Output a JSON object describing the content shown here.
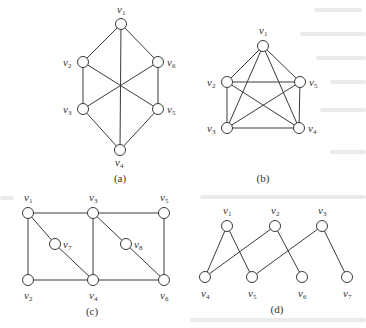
{
  "figure": {
    "node_radius": 5.5,
    "graphs": [
      {
        "id": "a",
        "caption": "(a)",
        "caption_pos": [
          120,
          182
        ],
        "nodes": [
          {
            "name": "v",
            "sub": "1",
            "x": 121,
            "y": 24,
            "lx": 117,
            "ly": 13
          },
          {
            "name": "v",
            "sub": "2",
            "x": 83,
            "y": 62,
            "lx": 63,
            "ly": 66
          },
          {
            "name": "v",
            "sub": "6",
            "x": 158,
            "y": 62,
            "lx": 167,
            "ly": 66
          },
          {
            "name": "v",
            "sub": "3",
            "x": 83,
            "y": 109,
            "lx": 63,
            "ly": 113
          },
          {
            "name": "v",
            "sub": "5",
            "x": 158,
            "y": 109,
            "lx": 167,
            "ly": 113
          },
          {
            "name": "v",
            "sub": "4",
            "x": 120,
            "y": 150,
            "lx": 115,
            "ly": 166
          }
        ],
        "edges": [
          [
            0,
            1
          ],
          [
            0,
            2
          ],
          [
            0,
            5
          ],
          [
            1,
            3
          ],
          [
            2,
            4
          ],
          [
            3,
            5
          ],
          [
            4,
            5
          ],
          [
            1,
            4
          ],
          [
            2,
            3
          ]
        ]
      },
      {
        "id": "b",
        "caption": "(b)",
        "caption_pos": [
          263,
          182
        ],
        "nodes": [
          {
            "name": "v",
            "sub": "1",
            "x": 263,
            "y": 46,
            "lx": 259,
            "ly": 34
          },
          {
            "name": "v",
            "sub": "2",
            "x": 227,
            "y": 82,
            "lx": 207,
            "ly": 86
          },
          {
            "name": "v",
            "sub": "5",
            "x": 300,
            "y": 82,
            "lx": 309,
            "ly": 86
          },
          {
            "name": "v",
            "sub": "3",
            "x": 227,
            "y": 128,
            "lx": 207,
            "ly": 132
          },
          {
            "name": "v",
            "sub": "4",
            "x": 299,
            "y": 128,
            "lx": 308,
            "ly": 132
          }
        ],
        "edges": [
          [
            0,
            1
          ],
          [
            0,
            2
          ],
          [
            0,
            3
          ],
          [
            0,
            4
          ],
          [
            1,
            2
          ],
          [
            1,
            3
          ],
          [
            1,
            4
          ],
          [
            2,
            3
          ],
          [
            2,
            4
          ],
          [
            3,
            4
          ]
        ]
      },
      {
        "id": "c",
        "caption": "(c)",
        "caption_pos": [
          92,
          315
        ],
        "nodes": [
          {
            "name": "v",
            "sub": "1",
            "x": 28,
            "y": 213,
            "lx": 24,
            "ly": 201
          },
          {
            "name": "v",
            "sub": "3",
            "x": 93,
            "y": 213,
            "lx": 89,
            "ly": 201
          },
          {
            "name": "v",
            "sub": "5",
            "x": 164,
            "y": 213,
            "lx": 160,
            "ly": 201
          },
          {
            "name": "v",
            "sub": "7",
            "x": 55,
            "y": 244,
            "lx": 63,
            "ly": 248
          },
          {
            "name": "v",
            "sub": "8",
            "x": 126,
            "y": 244,
            "lx": 134,
            "ly": 248
          },
          {
            "name": "v",
            "sub": "2",
            "x": 28,
            "y": 280,
            "lx": 24,
            "ly": 299
          },
          {
            "name": "v",
            "sub": "4",
            "x": 93,
            "y": 280,
            "lx": 89,
            "ly": 299
          },
          {
            "name": "v",
            "sub": "6",
            "x": 164,
            "y": 280,
            "lx": 160,
            "ly": 299
          }
        ],
        "edges": [
          [
            0,
            1
          ],
          [
            1,
            2
          ],
          [
            0,
            5
          ],
          [
            1,
            6
          ],
          [
            2,
            7
          ],
          [
            5,
            6
          ],
          [
            6,
            7
          ],
          [
            0,
            3
          ],
          [
            3,
            6
          ],
          [
            1,
            4
          ],
          [
            4,
            7
          ]
        ]
      },
      {
        "id": "d",
        "caption": "(d)",
        "caption_pos": [
          277,
          313
        ],
        "nodes": [
          {
            "name": "v",
            "sub": "1",
            "x": 227,
            "y": 226,
            "lx": 223,
            "ly": 214
          },
          {
            "name": "v",
            "sub": "2",
            "x": 275,
            "y": 226,
            "lx": 271,
            "ly": 214
          },
          {
            "name": "v",
            "sub": "3",
            "x": 322,
            "y": 226,
            "lx": 318,
            "ly": 214
          },
          {
            "name": "v",
            "sub": "4",
            "x": 205,
            "y": 277,
            "lx": 201,
            "ly": 297
          },
          {
            "name": "v",
            "sub": "5",
            "x": 252,
            "y": 277,
            "lx": 248,
            "ly": 297
          },
          {
            "name": "v",
            "sub": "6",
            "x": 302,
            "y": 277,
            "lx": 298,
            "ly": 297
          },
          {
            "name": "v",
            "sub": "7",
            "x": 347,
            "y": 277,
            "lx": 343,
            "ly": 297
          }
        ],
        "edges": [
          [
            0,
            3
          ],
          [
            0,
            4
          ],
          [
            1,
            3
          ],
          [
            1,
            5
          ],
          [
            2,
            4
          ],
          [
            2,
            6
          ]
        ]
      }
    ]
  }
}
